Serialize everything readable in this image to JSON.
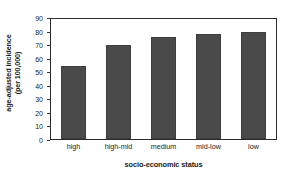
{
  "chart_data": {
    "type": "bar",
    "title": "",
    "subtitle": "",
    "xlabel": "socio-economic status",
    "ylabel": "age-adjusted incidence (per 100,000)",
    "ylabel_line1": "age-adjusted incidence",
    "ylabel_line2": "(per 100,000)",
    "categories": [
      "high",
      "high-mid",
      "medium",
      "mid-low",
      "low"
    ],
    "values": [
      55,
      70.5,
      76.5,
      78.5,
      80
    ],
    "ylim": [
      0,
      90
    ],
    "ytick_labels": [
      "0",
      "10",
      "20",
      "30",
      "40",
      "50",
      "60",
      "70",
      "80",
      "90"
    ],
    "ytick_values": [
      0,
      10,
      20,
      30,
      40,
      50,
      60,
      70,
      80,
      90
    ],
    "grid": false,
    "legend": false,
    "legend_position": "none",
    "bar_color": "#4a4a4a",
    "frame_color": "#2b2b2b",
    "background_color": "#ffffff"
  }
}
